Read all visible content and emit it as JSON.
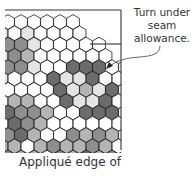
{
  "diagram": {
    "callout": {
      "lines": [
        "Turn under",
        "seam",
        "allowance."
      ]
    },
    "caption": "Appliqué edge of",
    "colors": {
      "W": "#ffffff",
      "L": "#e4e4e4",
      "M": "#b4b4b4",
      "G": "#8e8e8e",
      "D": "#6c6c6c",
      "stroke": "#1a1a1a",
      "frame": "#333333",
      "arrow": "#555555"
    },
    "hex": {
      "dx": 13,
      "dy": 11.3,
      "r": 7.4,
      "x0": 8,
      "y0": 22
    },
    "rows": [
      "WWWWWW",
      "LWLWWWW",
      "GGLWWWWW",
      "LGMWWWWWW",
      "GGLWWDDDWW",
      "LWWWDLLDWW",
      "WWWWDLMLDWW",
      "WMMWWDLLDWW",
      "DGGMWWDDDWW",
      "WDGMWWWWWWW",
      "GDMWWGMGMWW",
      "MMWMGMMGMWW",
      "GMMWGMDMGMW"
    ],
    "frame": {
      "top_line": {
        "x1": 5,
        "y1": 10,
        "x2": 121,
        "y2": 10
      },
      "right_line": {
        "x1": 121,
        "y1": 10,
        "x2": 121,
        "y2": 150
      },
      "step_line": {
        "x1": 90,
        "y1": 44,
        "x2": 121,
        "y2": 44
      }
    }
  }
}
